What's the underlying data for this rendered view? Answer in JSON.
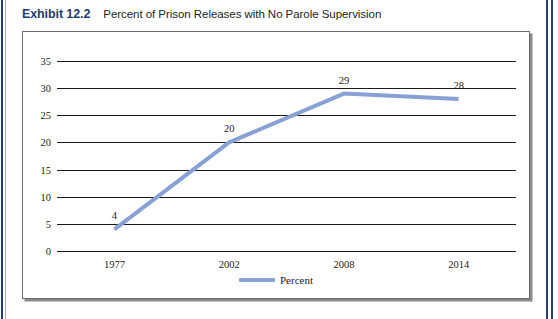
{
  "caption": {
    "label": "Exhibit 12.2",
    "title": "Percent of Prison Releases with No Parole Supervision"
  },
  "colors": {
    "series": "#88a1d4",
    "caption_label": "#1c3f72",
    "axis": "#1a1a1a",
    "page_rule": "#243f73",
    "frame_border": "#6b6b6b"
  },
  "chart_data": {
    "type": "line",
    "title": "Percent of Prison Releases with No Parole Supervision",
    "xlabel": "",
    "ylabel": "",
    "categories": [
      "1977",
      "2002",
      "2008",
      "2014"
    ],
    "values": [
      4,
      20,
      29,
      28
    ],
    "point_labels": [
      "4",
      "20",
      "29",
      "28"
    ],
    "yticks": [
      "0",
      "5",
      "10",
      "15",
      "20",
      "25",
      "30",
      "35"
    ],
    "ytick_values": [
      0,
      5,
      10,
      15,
      20,
      25,
      30,
      35
    ],
    "ylim": [
      0,
      35
    ],
    "grid": true,
    "legend": [
      {
        "name": "Percent",
        "color": "#88a1d4"
      }
    ],
    "legend_position": "bottom"
  }
}
